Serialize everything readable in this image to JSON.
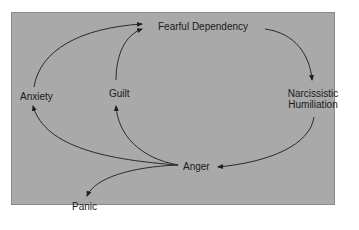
{
  "diagram": {
    "type": "cycle-flow",
    "background_color": "#a9a9a9",
    "nodes": {
      "fearful_dependency": "Fearful Dependency",
      "narcissistic_humiliation_line1": "Narcissistic",
      "narcissistic_humiliation_line2": "Humiliation",
      "anger": "Anger",
      "anxiety": "Anxiety",
      "guilt": "Guilt",
      "panic": "Panic"
    },
    "edges": [
      {
        "from": "Fearful Dependency",
        "to": "Narcissistic Humiliation"
      },
      {
        "from": "Narcissistic Humiliation",
        "to": "Anger"
      },
      {
        "from": "Anger",
        "to": "Anxiety"
      },
      {
        "from": "Anger",
        "to": "Guilt"
      },
      {
        "from": "Anger",
        "to": "Panic"
      },
      {
        "from": "Anxiety",
        "to": "Fearful Dependency"
      },
      {
        "from": "Guilt",
        "to": "Fearful Dependency"
      }
    ]
  }
}
